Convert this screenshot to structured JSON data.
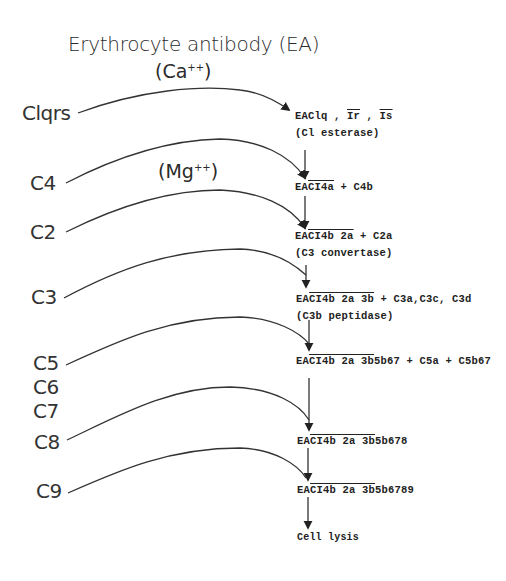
{
  "diagram": {
    "title": "Erythrocyte antibody (EA)",
    "cofactors": {
      "calcium": {
        "prefix": "(Ca",
        "sup": "++",
        "suffix": ")"
      },
      "magnesium": {
        "prefix": "(Mg",
        "sup": "++",
        "suffix": ")"
      }
    },
    "components": [
      {
        "id": "c1qrs",
        "label": "Clqrs"
      },
      {
        "id": "c4",
        "label": "C4"
      },
      {
        "id": "c2",
        "label": "C2"
      },
      {
        "id": "c3",
        "label": "C3"
      },
      {
        "id": "c5",
        "label": "C5"
      },
      {
        "id": "c6",
        "label": "C6"
      },
      {
        "id": "c7",
        "label": "C7"
      },
      {
        "id": "c8",
        "label": "C8"
      },
      {
        "id": "c9",
        "label": "C9"
      }
    ],
    "products": [
      {
        "pre": "EAClq , ",
        "ov1": "Ir",
        "mid": " , ",
        "ov2": "Is",
        "post": "",
        "note": "(Cl esterase)"
      },
      {
        "pre": "EA",
        "ov1": "CI4a",
        "post": "  +  C4b",
        "note": ""
      },
      {
        "pre": "EA",
        "ov1": "CI4b 2a",
        "post": " + C2a",
        "note": "(C3 convertase)"
      },
      {
        "pre": "EA",
        "ov1": "CI4b 2a 3b",
        "post": " + C3a,C3c, C3d",
        "note": "(C3b peptidase)"
      },
      {
        "pre": "EA",
        "ov1": "CI4b 2a 3b",
        "post": "5b67 + C5a + C5b67",
        "note": ""
      },
      {
        "pre": "EA",
        "ov1": "CI4b 2a 3b",
        "post": "5b678",
        "note": ""
      },
      {
        "pre": "EA",
        "ov1": "CI4b 2a 3b",
        "post": "5b6789",
        "note": ""
      }
    ],
    "final": "Cell lysis"
  }
}
